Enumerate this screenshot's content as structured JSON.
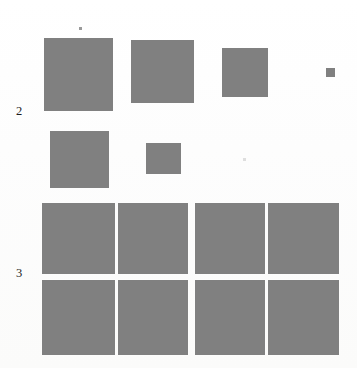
{
  "page": {
    "width": 357,
    "height": 368,
    "background_color": "#fdfdfc",
    "block_color": "#808080",
    "label_color": "#1d1d1d"
  },
  "row_labels": [
    {
      "text": "2",
      "x": 16,
      "y": 105
    },
    {
      "text": "3",
      "x": 16,
      "y": 267
    }
  ],
  "figure_rows": [
    {
      "name": "row-2-upper",
      "label": "2",
      "blocks": [
        {
          "x": 44,
          "y": 38,
          "w": 69,
          "h": 73
        },
        {
          "x": 131,
          "y": 40,
          "w": 63,
          "h": 63
        },
        {
          "x": 222,
          "y": 48,
          "w": 46,
          "h": 49
        },
        {
          "x": 326,
          "y": 68,
          "w": 9,
          "h": 9
        }
      ]
    },
    {
      "name": "row-2-lower",
      "label": "2",
      "blocks": [
        {
          "x": 50,
          "y": 131,
          "w": 59,
          "h": 57
        },
        {
          "x": 146,
          "y": 143,
          "w": 35,
          "h": 31
        }
      ]
    },
    {
      "name": "row-3-grid-upper",
      "label": "3",
      "blocks": [
        {
          "x": 42,
          "y": 203,
          "w": 73,
          "h": 71
        },
        {
          "x": 118,
          "y": 203,
          "w": 70,
          "h": 71
        },
        {
          "x": 195,
          "y": 203,
          "w": 70,
          "h": 71
        },
        {
          "x": 268,
          "y": 203,
          "w": 71,
          "h": 71
        }
      ]
    },
    {
      "name": "row-3-grid-lower",
      "label": "3",
      "blocks": [
        {
          "x": 42,
          "y": 280,
          "w": 73,
          "h": 75
        },
        {
          "x": 118,
          "y": 280,
          "w": 70,
          "h": 75
        },
        {
          "x": 195,
          "y": 280,
          "w": 70,
          "h": 75
        },
        {
          "x": 268,
          "y": 280,
          "w": 71,
          "h": 75
        }
      ]
    }
  ],
  "specks": [
    {
      "x": 79,
      "y": 27,
      "w": 3,
      "h": 3,
      "faint": false
    },
    {
      "x": 243,
      "y": 158,
      "w": 3,
      "h": 3,
      "faint": true
    }
  ]
}
